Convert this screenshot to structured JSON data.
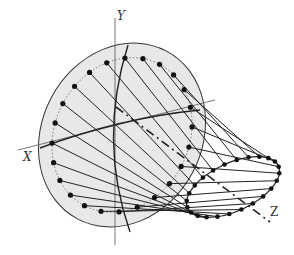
{
  "diagram": {
    "type": "3d-projection-cone",
    "axes": {
      "x_label": "X",
      "y_label": "Y",
      "z_label": "Z"
    },
    "colors": {
      "plane_fill": "#e6e6e6",
      "stroke": "#222222",
      "dot": "#111111",
      "axis": "#555555"
    },
    "large_circle_points": 24,
    "small_ellipse_points": 24
  }
}
